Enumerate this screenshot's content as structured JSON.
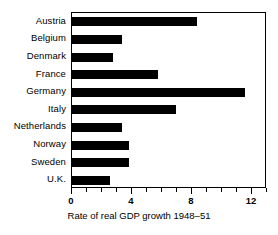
{
  "chart_data": {
    "type": "bar",
    "orientation": "horizontal",
    "title": "",
    "xlabel": "Rate of real GDP growth 1948–51",
    "ylabel": "",
    "categories": [
      "Austria",
      "Belgium",
      "Denmark",
      "France",
      "Germany",
      "Italy",
      "Netherlands",
      "Norway",
      "Sweden",
      "U.K."
    ],
    "values": [
      8.3,
      3.3,
      2.7,
      5.7,
      11.5,
      6.9,
      3.3,
      3.8,
      3.8,
      2.5
    ],
    "xlim": [
      0,
      13
    ],
    "xticks": [
      0,
      4,
      8,
      12
    ],
    "xtick_labels": [
      "0",
      "4",
      "8",
      "12"
    ],
    "minor_tick_step": 1,
    "grid": false,
    "legend": null,
    "bar_color": "#000000",
    "background_color": "#ffffff",
    "frame_color": "#000000"
  }
}
